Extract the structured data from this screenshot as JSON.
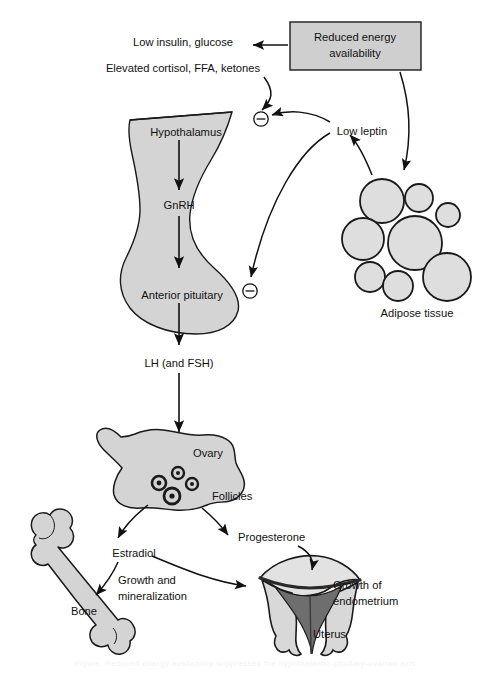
{
  "figure": {
    "caption_faint": "Figure. Reduced energy availability suppresses the hypothalamic-pituitary-ovarian axis.",
    "colors": {
      "organ_fill": "#d4d4d4",
      "box_fill": "#cfcfcf",
      "outline": "#1a1a1a",
      "endometrium_dark": "#6e6e6e",
      "uterus_light": "#d8d8d8",
      "background": "#ffffff"
    }
  },
  "nodes": {
    "reduced_energy": "Reduced energy availability",
    "low_insulin": "Low insulin, glucose",
    "elevated_cortisol": "Elevated cortisol, FFA, ketones",
    "low_leptin": "Low leptin",
    "hypothalamus": "Hypothalamus",
    "gnrh": "GnRH",
    "anterior_pituitary": "Anterior pituitary",
    "lh_fsh": "LH (and FSH)",
    "adipose": "Adipose tissue",
    "ovary": "Ovary",
    "follicles": "Follicles",
    "estradiol": "Estradiol",
    "progesterone": "Progesterone",
    "growth_mineralization_line1": "Growth and",
    "growth_mineralization_line2": "mineralization",
    "bone": "Bone",
    "growth_endometrium_line1": "Growth of",
    "growth_endometrium_line2": "endometrium",
    "uterus": "Uterus"
  },
  "signs": {
    "inhibition_upper": "⊖",
    "inhibition_lower": "⊖"
  },
  "edges": [
    {
      "name": "reduced-energy-to-metabolites",
      "from": "reduced_energy",
      "to": "low_insulin",
      "kind": "arrow"
    },
    {
      "name": "metabolites-to-hypothalamus-inhibition",
      "from": "elevated_cortisol",
      "to": "inhibition_upper",
      "kind": "curved-arrow"
    },
    {
      "name": "low-leptin-to-hypothalamus-inhibition",
      "from": "low_leptin",
      "to": "inhibition_upper",
      "kind": "curved-arrow"
    },
    {
      "name": "low-leptin-to-pituitary-inhibition",
      "from": "low_leptin",
      "to": "inhibition_lower",
      "kind": "curved-arrow"
    },
    {
      "name": "adipose-to-low-leptin",
      "from": "adipose",
      "to": "low_leptin",
      "kind": "curved-arrow"
    },
    {
      "name": "reduced-energy-to-adipose",
      "from": "reduced_energy",
      "to": "adipose",
      "kind": "curved-arrow"
    },
    {
      "name": "hypothalamus-to-gnrh",
      "from": "hypothalamus",
      "to": "gnrh",
      "kind": "arrow"
    },
    {
      "name": "gnrh-to-pituitary",
      "from": "gnrh",
      "to": "anterior_pituitary",
      "kind": "arrow"
    },
    {
      "name": "pituitary-to-lh",
      "from": "anterior_pituitary",
      "to": "lh_fsh",
      "kind": "arrow"
    },
    {
      "name": "lh-to-ovary",
      "from": "lh_fsh",
      "to": "ovary",
      "kind": "arrow"
    },
    {
      "name": "ovary-to-estradiol",
      "from": "ovary",
      "to": "estradiol",
      "kind": "curved-arrow"
    },
    {
      "name": "ovary-to-progesterone",
      "from": "ovary",
      "to": "progesterone",
      "kind": "curved-arrow"
    },
    {
      "name": "estradiol-to-bone",
      "from": "estradiol",
      "to": "bone",
      "kind": "curved-arrow"
    },
    {
      "name": "estradiol-to-uterus",
      "from": "estradiol",
      "to": "uterus",
      "kind": "curved-arrow"
    },
    {
      "name": "progesterone-to-uterus",
      "from": "progesterone",
      "to": "uterus",
      "kind": "curved-arrow"
    }
  ],
  "adipose_cells": [
    {
      "cx": 382,
      "cy": 201,
      "r": 22
    },
    {
      "cx": 419,
      "cy": 198,
      "r": 14
    },
    {
      "cx": 448,
      "cy": 215,
      "r": 12
    },
    {
      "cx": 363,
      "cy": 239,
      "r": 21
    },
    {
      "cx": 415,
      "cy": 243,
      "r": 27
    },
    {
      "cx": 370,
      "cy": 277,
      "r": 15
    },
    {
      "cx": 398,
      "cy": 286,
      "r": 15
    },
    {
      "cx": 447,
      "cy": 277,
      "r": 24
    }
  ],
  "follicles": [
    {
      "cx": 159,
      "cy": 483,
      "r": 7
    },
    {
      "cx": 178,
      "cy": 473,
      "r": 6
    },
    {
      "cx": 192,
      "cy": 484,
      "r": 6
    },
    {
      "cx": 172,
      "cy": 496,
      "r": 8
    }
  ]
}
